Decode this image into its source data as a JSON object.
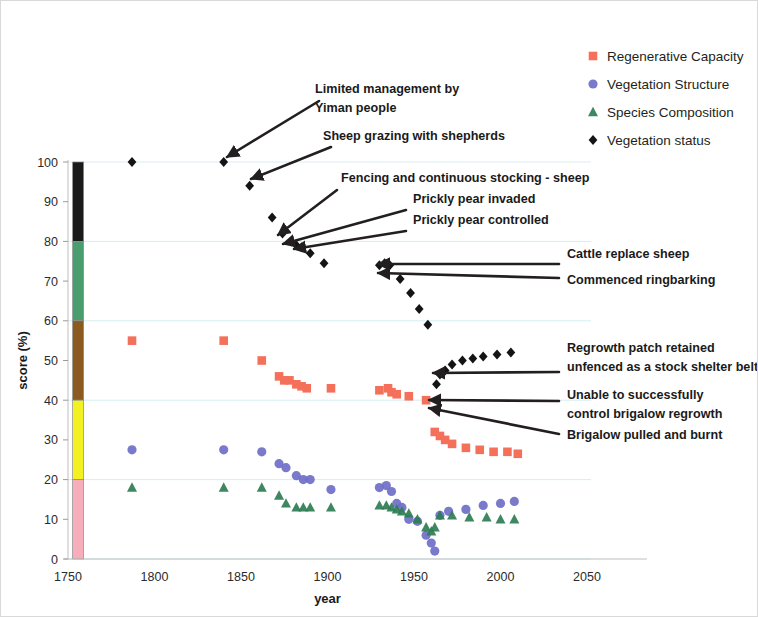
{
  "chart_data": {
    "type": "scatter",
    "title": "",
    "xlabel": "year",
    "ylabel": "score (%)",
    "xlim": [
      1750,
      2050
    ],
    "ylim": [
      0,
      100
    ],
    "xticks": [
      1750,
      1800,
      1850,
      1900,
      1950,
      2000,
      2050
    ],
    "yticks": [
      0,
      10,
      20,
      30,
      40,
      50,
      60,
      70,
      80,
      90,
      100
    ],
    "grid": true,
    "legend_position": "top-right",
    "series": [
      {
        "name": "Regenerative Capacity",
        "marker": "square",
        "color": "#F4705A",
        "points": [
          [
            1787,
            55
          ],
          [
            1840,
            55
          ],
          [
            1862,
            50
          ],
          [
            1872,
            46
          ],
          [
            1875,
            45
          ],
          [
            1878,
            45
          ],
          [
            1882,
            44
          ],
          [
            1885,
            43.5
          ],
          [
            1888,
            43
          ],
          [
            1902,
            43
          ],
          [
            1930,
            42.5
          ],
          [
            1935,
            43
          ],
          [
            1937,
            42
          ],
          [
            1940,
            41.5
          ],
          [
            1947,
            41
          ],
          [
            1957,
            40
          ],
          [
            1962,
            32
          ],
          [
            1965,
            31
          ],
          [
            1968,
            30
          ],
          [
            1972,
            29
          ],
          [
            1980,
            28
          ],
          [
            1988,
            27.5
          ],
          [
            1996,
            27
          ],
          [
            2004,
            27
          ],
          [
            2010,
            26.5
          ]
        ]
      },
      {
        "name": "Vegetation Structure",
        "marker": "circle",
        "color": "#6E6FC8",
        "points": [
          [
            1787,
            27.5
          ],
          [
            1840,
            27.5
          ],
          [
            1862,
            27
          ],
          [
            1872,
            24
          ],
          [
            1876,
            23
          ],
          [
            1882,
            21
          ],
          [
            1886,
            20
          ],
          [
            1890,
            20
          ],
          [
            1902,
            17.5
          ],
          [
            1930,
            18
          ],
          [
            1934,
            18.5
          ],
          [
            1937,
            17
          ],
          [
            1940,
            14
          ],
          [
            1943,
            13
          ],
          [
            1947,
            10
          ],
          [
            1952,
            9.5
          ],
          [
            1957,
            6
          ],
          [
            1960,
            4
          ],
          [
            1962,
            2
          ],
          [
            1965,
            11
          ],
          [
            1970,
            12
          ],
          [
            1980,
            12.5
          ],
          [
            1990,
            13.5
          ],
          [
            2000,
            14
          ],
          [
            2008,
            14.5
          ]
        ]
      },
      {
        "name": "Species Composition",
        "marker": "triangle",
        "color": "#2E7D52",
        "points": [
          [
            1787,
            18
          ],
          [
            1840,
            18
          ],
          [
            1862,
            18
          ],
          [
            1872,
            16
          ],
          [
            1876,
            14
          ],
          [
            1882,
            13
          ],
          [
            1886,
            13
          ],
          [
            1890,
            13
          ],
          [
            1902,
            13
          ],
          [
            1930,
            13.5
          ],
          [
            1934,
            13.5
          ],
          [
            1937,
            13
          ],
          [
            1940,
            12.5
          ],
          [
            1943,
            12
          ],
          [
            1947,
            11.5
          ],
          [
            1952,
            10
          ],
          [
            1957,
            8
          ],
          [
            1960,
            7
          ],
          [
            1962,
            8
          ],
          [
            1965,
            11
          ],
          [
            1972,
            11
          ],
          [
            1982,
            10.5
          ],
          [
            1992,
            10.5
          ],
          [
            2000,
            10
          ],
          [
            2008,
            10
          ]
        ]
      },
      {
        "name": "Vegetation status",
        "marker": "diamond",
        "color": "#141414",
        "points": [
          [
            1787,
            100
          ],
          [
            1840,
            100
          ],
          [
            1855,
            94
          ],
          [
            1868,
            86
          ],
          [
            1874,
            82
          ],
          [
            1879,
            80
          ],
          [
            1882,
            79
          ],
          [
            1885,
            78.5
          ],
          [
            1890,
            77
          ],
          [
            1898,
            74.5
          ],
          [
            1930,
            74
          ],
          [
            1933,
            74.5
          ],
          [
            1936,
            74
          ],
          [
            1942,
            70.5
          ],
          [
            1948,
            67
          ],
          [
            1953,
            63
          ],
          [
            1958,
            59
          ],
          [
            1963,
            44
          ],
          [
            1965,
            46.5
          ],
          [
            1968,
            47.5
          ],
          [
            1972,
            49
          ],
          [
            1978,
            50
          ],
          [
            1984,
            50.5
          ],
          [
            1990,
            51
          ],
          [
            1998,
            51.5
          ],
          [
            2006,
            52
          ]
        ]
      }
    ],
    "color_bar": {
      "x_year": 1755,
      "bands": [
        {
          "from": 80,
          "to": 100,
          "color": "#1A1A1A"
        },
        {
          "from": 60,
          "to": 80,
          "color": "#4A9D6E"
        },
        {
          "from": 40,
          "to": 60,
          "color": "#8A5A20"
        },
        {
          "from": 20,
          "to": 40,
          "color": "#F2F222"
        },
        {
          "from": 0,
          "to": 20,
          "color": "#F6AEBB"
        }
      ]
    },
    "annotations": [
      {
        "id": "limited-management",
        "lines": [
          "Limited management by",
          "Yiman people"
        ],
        "target": [
          1840,
          100
        ]
      },
      {
        "id": "sheep-grazing",
        "lines": [
          "Sheep grazing with shepherds"
        ],
        "target": [
          1855,
          94
        ]
      },
      {
        "id": "fencing-stocking",
        "lines": [
          "Fencing and continuous stocking - sheep"
        ],
        "target": [
          1874,
          82
        ]
      },
      {
        "id": "prickly-pear-invaded",
        "lines": [
          "Prickly pear invaded"
        ],
        "target": [
          1879,
          80
        ]
      },
      {
        "id": "prickly-pear-controlled",
        "lines": [
          "Prickly pear controlled"
        ],
        "target": [
          1890,
          77
        ]
      },
      {
        "id": "cattle-replace-sheep",
        "lines": [
          "Cattle replace sheep"
        ],
        "target": [
          1933,
          74.5
        ]
      },
      {
        "id": "commenced-ringbarking",
        "lines": [
          "Commenced ringbarking"
        ],
        "target": [
          1936,
          74
        ]
      },
      {
        "id": "regrowth-patch",
        "lines": [
          "Regrowth patch retained",
          "unfenced as a stock shelter belt"
        ],
        "target": [
          1965,
          46.5
        ]
      },
      {
        "id": "unable-control-regrowth",
        "lines": [
          "Unable to successfully",
          "control brigalow regrowth"
        ],
        "target": [
          1963,
          44
        ]
      },
      {
        "id": "brigalow-pulled-burnt",
        "lines": [
          "Brigalow pulled and burnt"
        ],
        "target": [
          1962,
          40
        ]
      }
    ]
  },
  "legend": {
    "items": [
      {
        "label": "Regenerative Capacity",
        "marker": "square",
        "color": "#F4705A"
      },
      {
        "label": "Vegetation Structure",
        "marker": "circle",
        "color": "#6E6FC8"
      },
      {
        "label": "Species Composition",
        "marker": "triangle",
        "color": "#2E7D52"
      },
      {
        "label": "Vegetation status",
        "marker": "diamond",
        "color": "#141414"
      }
    ]
  },
  "axes": {
    "x_title": "year",
    "y_title": "score (%)",
    "x_tick_labels": [
      "1750",
      "1800",
      "1850",
      "1900",
      "1950",
      "2000",
      "2050"
    ],
    "y_tick_labels": [
      "0",
      "10",
      "20",
      "30",
      "40",
      "50",
      "60",
      "70",
      "80",
      "90",
      "100"
    ]
  }
}
